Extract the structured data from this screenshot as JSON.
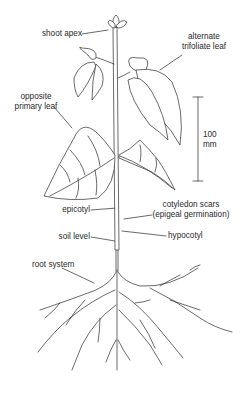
{
  "diagram": {
    "labels": {
      "shoot_apex": "shoot apex",
      "alternate_trifoliate_leaf_1": "alternate",
      "alternate_trifoliate_leaf_2": "trifoliate leaf",
      "opposite_primary_leaf_1": "opposite",
      "opposite_primary_leaf_2": "primary leaf",
      "scale_value": "100",
      "scale_unit": "mm",
      "cotyledon_scars_1": "cotyledon scars",
      "cotyledon_scars_2": "(epigeal germination)",
      "epicotyl": "epicotyl",
      "soil_level": "soil level",
      "hypocotyl": "hypocotyl",
      "root_system": "root system"
    },
    "scale_bar": {
      "length_mm": 100
    },
    "colors": {
      "line": "#2a2a2a",
      "background": "#ffffff"
    }
  }
}
